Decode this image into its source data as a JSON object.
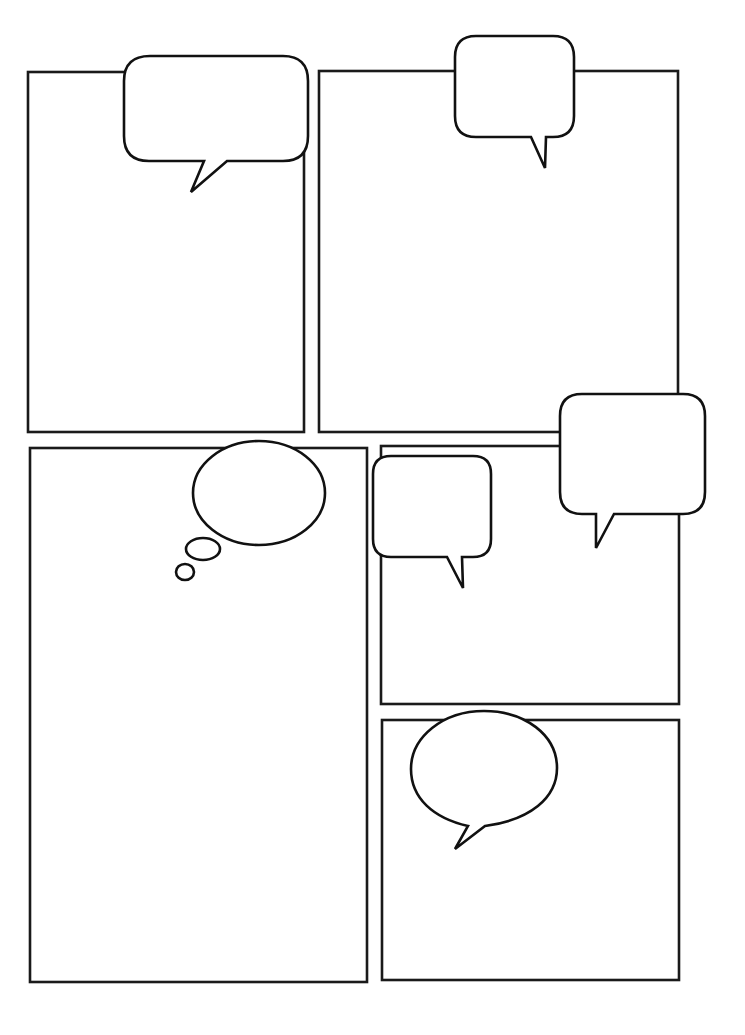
{
  "page": {
    "type": "blank comic page template",
    "background": "#ffffff",
    "line_color": "#1a1a1a"
  },
  "panels": [
    {
      "id": "panel-1",
      "x": 28,
      "y": 72,
      "w": 276,
      "h": 360
    },
    {
      "id": "panel-2",
      "x": 319,
      "y": 71,
      "w": 359,
      "h": 361
    },
    {
      "id": "panel-3",
      "x": 30,
      "y": 448,
      "w": 337,
      "h": 534
    },
    {
      "id": "panel-4",
      "x": 381,
      "y": 446,
      "w": 298,
      "h": 258
    },
    {
      "id": "panel-5",
      "x": 382,
      "y": 720,
      "w": 297,
      "h": 260
    }
  ],
  "bubbles": [
    {
      "id": "speech-bubble-1",
      "kind": "rounded-rect speech",
      "text": ""
    },
    {
      "id": "speech-bubble-2",
      "kind": "rounded-rect speech",
      "text": ""
    },
    {
      "id": "speech-bubble-3",
      "kind": "rounded-rect speech",
      "text": ""
    },
    {
      "id": "speech-bubble-4",
      "kind": "rounded-rect speech",
      "text": ""
    },
    {
      "id": "thought-bubble-1",
      "kind": "oval thought",
      "text": ""
    },
    {
      "id": "speech-bubble-5",
      "kind": "oval speech",
      "text": ""
    }
  ]
}
